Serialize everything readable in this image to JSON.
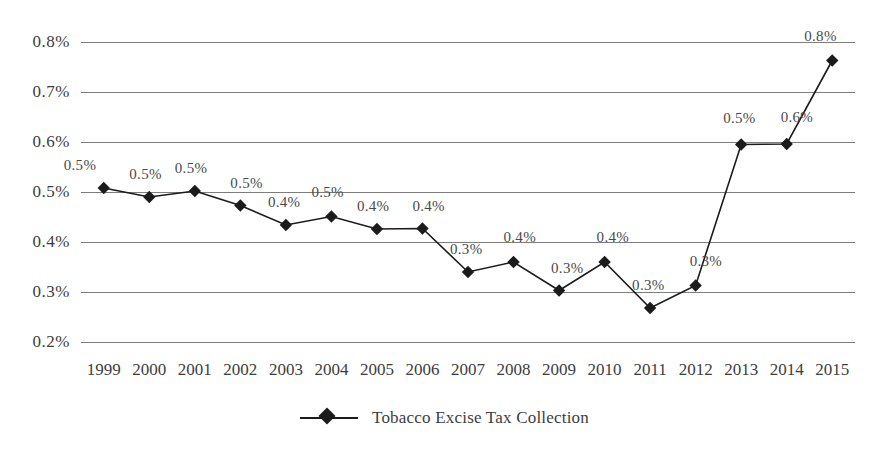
{
  "chart_data": {
    "type": "line",
    "title": "",
    "subtitle": "",
    "xlabel": "",
    "ylabel": "",
    "categories": [
      "1999",
      "2000",
      "2001",
      "2002",
      "2003",
      "2004",
      "2005",
      "2006",
      "2007",
      "2008",
      "2009",
      "2010",
      "2011",
      "2012",
      "2013",
      "2014",
      "2015"
    ],
    "series": [
      {
        "name": "Tobacco Excise Tax Collection",
        "values": [
          0.508,
          0.49,
          0.502,
          0.473,
          0.434,
          0.451,
          0.426,
          0.427,
          0.34,
          0.36,
          0.303,
          0.36,
          0.268,
          0.313,
          0.595,
          0.596,
          0.763
        ],
        "labels": [
          "0.5%",
          "0.5%",
          "0.5%",
          "0.5%",
          "0.4%",
          "0.5%",
          "0.4%",
          "0.4%",
          "0.3%",
          "0.4%",
          "0.3%",
          "0.4%",
          "0.3%",
          "0.3%",
          "0.5%",
          "0.6%",
          "0.8%"
        ],
        "color": "#1b1b1b",
        "marker": "diamond"
      }
    ],
    "ylim": [
      0.2,
      0.8
    ],
    "yticks": [
      0.8,
      0.7,
      0.6,
      0.5,
      0.4,
      0.3,
      0.2
    ],
    "ytick_labels": [
      "0.8%",
      "0.7%",
      "0.6%",
      "0.5%",
      "0.4%",
      "0.3%",
      "0.2%"
    ],
    "grid": true,
    "grid_color": "#7d7d7d",
    "legend_position": "bottom",
    "background_color": "#ffffff"
  },
  "legend": {
    "entries": [
      {
        "label": "Tobacco Excise Tax Collection"
      }
    ]
  }
}
